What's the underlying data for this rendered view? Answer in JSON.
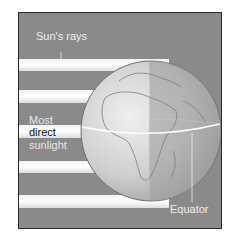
{
  "diagram": {
    "labels": {
      "sun_rays": "Sun's rays",
      "most": "Most",
      "direct": "direct",
      "sunlight": "sunlight",
      "equator": "Equator"
    },
    "colors": {
      "background": "#8a8a8a",
      "ray": "#eeeeee",
      "globe_lit": "#d4d4d4",
      "globe_shadow": "#a8a8a8",
      "equator_line": "#ffffff",
      "text_light": "#eeeeee",
      "text_dark": "#111111"
    },
    "ray_count": 5
  }
}
